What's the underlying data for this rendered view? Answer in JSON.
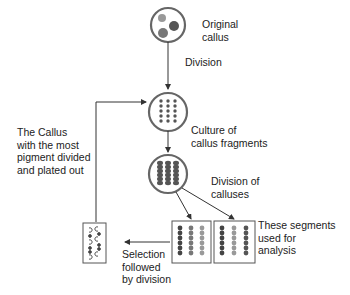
{
  "labels": {
    "original_callus": [
      "Original",
      "callus"
    ],
    "division": "Division",
    "culture": [
      "Culture of",
      "callus fragments"
    ],
    "division_of_calluses": [
      "Division of",
      "calluses"
    ],
    "segments_analysis": [
      "These segments",
      "used for",
      "analysis"
    ],
    "selection": [
      "Selection",
      "followed",
      "by division"
    ],
    "callus_most_pigment": [
      "The Callus",
      "with the most",
      "pigment divided",
      "and plated out"
    ]
  },
  "nodes": [
    {
      "id": "original-callus",
      "shape": "circle",
      "cx": 168,
      "cy": 25,
      "r": 17
    },
    {
      "id": "callus-fragments",
      "shape": "circle",
      "cx": 168,
      "cy": 112,
      "r": 19
    },
    {
      "id": "cultured-calluses",
      "shape": "circle",
      "cx": 168,
      "cy": 174,
      "r": 19
    },
    {
      "id": "selected-segments-box",
      "shape": "rect",
      "x": 83,
      "y": 223,
      "w": 23,
      "h": 40
    },
    {
      "id": "segments-box-1",
      "shape": "rect",
      "x": 172,
      "y": 221,
      "w": 39,
      "h": 42
    },
    {
      "id": "segments-box-2",
      "shape": "rect",
      "x": 214,
      "y": 221,
      "w": 41,
      "h": 42
    }
  ],
  "colors": {
    "line": "#333333",
    "circle_stroke": "#555555",
    "dark_dot": "#444444",
    "mid_dot": "#777777",
    "light_dot": "#999999"
  }
}
